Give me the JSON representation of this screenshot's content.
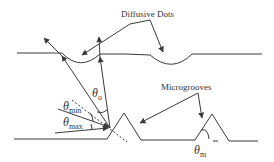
{
  "diagram": {
    "labels": {
      "diffusive_dots": "Diffusive Dots",
      "microgrooves": "Microgrooves",
      "theta_o": {
        "symbol": "θ",
        "sub": "o"
      },
      "theta_min": {
        "symbol": "θ",
        "sub": "min"
      },
      "theta_max": {
        "symbol": "θ",
        "sub": "max"
      },
      "theta_m": {
        "symbol": "θ",
        "sub": "m"
      }
    },
    "colors": {
      "line": "#3a3a3a",
      "text": "#333333",
      "background": "#ffffff"
    }
  }
}
